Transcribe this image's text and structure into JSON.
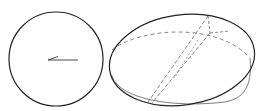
{
  "diagram": {
    "figures": [
      {
        "id": "circle-view",
        "shape": "circle",
        "cx": 55,
        "cy": 59,
        "r": 47,
        "stroke": "#222222",
        "arrow": {
          "x1": 78,
          "y1": 60,
          "x2": 47,
          "y2": 60,
          "direction": "left"
        }
      },
      {
        "id": "ellipse-view",
        "shape": "ellipse",
        "cx": 182,
        "cy": 58,
        "rx": 73,
        "ry": 45,
        "rotation": -8,
        "stroke": "#222222",
        "dashed_equator": true,
        "dashed_diagonals": 2,
        "offset_outline": true
      }
    ],
    "colors": {
      "stroke": "#222222",
      "dashed": "#555555",
      "background": "#ffffff"
    }
  }
}
